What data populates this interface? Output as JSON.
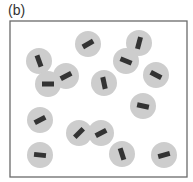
{
  "panel_label": "(b)",
  "colors": {
    "frame": "#6a6a6a",
    "particle": "#cdcdcd",
    "bar": "#333333"
  },
  "frame": {
    "x": 10,
    "y": 21,
    "width": 177,
    "height": 156
  },
  "particle_radius": 13,
  "bar": {
    "length": 12,
    "thickness": 5
  },
  "particles": [
    {
      "cx": 88,
      "cy": 44,
      "angle": -30
    },
    {
      "cx": 139,
      "cy": 43,
      "angle": -75
    },
    {
      "cx": 39,
      "cy": 61,
      "angle": 70
    },
    {
      "cx": 126,
      "cy": 61,
      "angle": 22
    },
    {
      "cx": 66,
      "cy": 76,
      "angle": -28
    },
    {
      "cx": 156,
      "cy": 75,
      "angle": 28
    },
    {
      "cx": 48,
      "cy": 84,
      "angle": 0
    },
    {
      "cx": 104,
      "cy": 83,
      "angle": 78
    },
    {
      "cx": 143,
      "cy": 106,
      "angle": 12
    },
    {
      "cx": 40,
      "cy": 120,
      "angle": -28
    },
    {
      "cx": 79,
      "cy": 133,
      "angle": -45
    },
    {
      "cx": 101,
      "cy": 133,
      "angle": -28
    },
    {
      "cx": 40,
      "cy": 155,
      "angle": 6
    },
    {
      "cx": 122,
      "cy": 154,
      "angle": 72
    },
    {
      "cx": 164,
      "cy": 155,
      "angle": -15
    }
  ]
}
